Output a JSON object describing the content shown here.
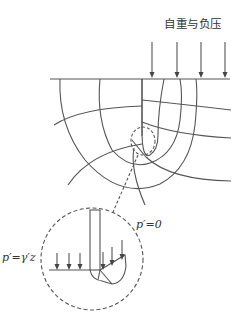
{
  "diagram": {
    "load_label": "自重与负压",
    "label_p_zero": "p′=0",
    "label_p_gamma_z": "p′=γ′z",
    "colors": {
      "line": "#555555",
      "text": "#333333",
      "background": "#ffffff"
    },
    "elements": [
      "ground-surface-line",
      "sheet-pile-wall",
      "flow-net-streamlines",
      "flow-net-equipotentials",
      "surface-load-arrows",
      "detail-callout-circle",
      "detail-magnified-view"
    ]
  }
}
